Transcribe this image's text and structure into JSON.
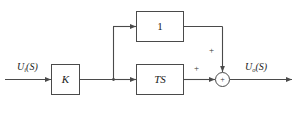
{
  "diagram": {
    "stroke_color": "#4a4a4a",
    "text_color": "#1a1a1a",
    "background": "#ffffff"
  },
  "signals": {
    "input": {
      "base": "U",
      "subscript": "i",
      "argument": "(S)"
    },
    "output": {
      "base": "U",
      "subscript": "o",
      "argument": "(S)"
    }
  },
  "blocks": {
    "gain": {
      "label": "K"
    },
    "feedforward": {
      "label": "1"
    },
    "derivative": {
      "label": "TS"
    }
  },
  "summing_junction": {
    "glyph": "+",
    "horizontal_input_sign": "+",
    "vertical_input_sign": "+"
  }
}
